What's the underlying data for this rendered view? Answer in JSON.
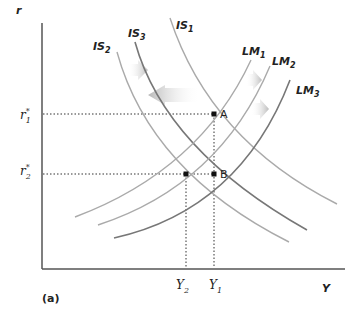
{
  "diagram": {
    "type": "IS-LM",
    "panel_label": "(a)",
    "axes": {
      "y_label": "r",
      "x_label": "Y"
    },
    "y_ticks": [
      {
        "base": "r",
        "sup": "*",
        "sub": "1"
      },
      {
        "base": "r",
        "sup": "*",
        "sub": "2"
      }
    ],
    "x_ticks": [
      {
        "base": "Y",
        "sub": "2"
      },
      {
        "base": "Y",
        "sub": "1"
      }
    ],
    "curves": {
      "IS1": {
        "base": "IS",
        "sub": "1"
      },
      "IS2": {
        "base": "IS",
        "sub": "2"
      },
      "IS3": {
        "base": "IS",
        "sub": "3"
      },
      "LM1": {
        "base": "LM",
        "sub": "1"
      },
      "LM2": {
        "base": "LM",
        "sub": "2"
      },
      "LM3": {
        "base": "LM",
        "sub": "3"
      }
    },
    "points": {
      "A": "A",
      "B": "B"
    },
    "colors": {
      "axis": "#555555",
      "dark_curve": "#777777",
      "light_curve": "#aaaaaa",
      "arrow": "#c8c8c8"
    }
  }
}
